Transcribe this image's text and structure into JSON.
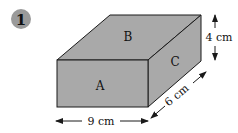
{
  "problem": {
    "number": "1",
    "badge_color": "#9a9a9a"
  },
  "box": {
    "faces": {
      "front": "A",
      "top": "B",
      "side": "C"
    },
    "face_color": "#a9a9a9",
    "edge_color": "#1a1a1a"
  },
  "dimensions": {
    "height": "4 cm",
    "length": "9 cm",
    "depth": "6 cm"
  }
}
